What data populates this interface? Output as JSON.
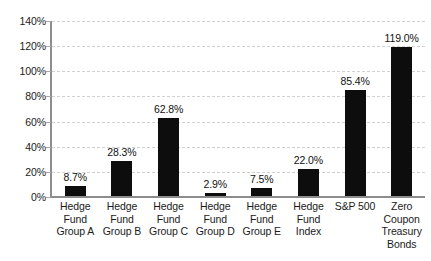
{
  "chart_data": {
    "type": "bar",
    "title": "",
    "subtitle": "",
    "xlabel": "",
    "ylabel": "",
    "ylim": [
      0,
      140
    ],
    "ytick_labels": [
      "140%",
      "120%",
      "100%",
      "80%",
      "60%",
      "40%",
      "20%",
      "0%"
    ],
    "ytick_values": [
      140,
      120,
      100,
      80,
      60,
      40,
      20,
      0
    ],
    "ytick_format": "percent",
    "grid": true,
    "grid_style": "dashed",
    "grid_axis": "y",
    "legend": "none",
    "bar_color": "#0d0d0d",
    "gridline_color": "#d2d2d2",
    "axis_color": "#8c8c8c",
    "categories": [
      "Hedge Fund Group A",
      "Hedge Fund Group B",
      "Hedge Fund Group C",
      "Hedge Fund Group D",
      "Hedge Fund Group E",
      "Hedge Fund Index",
      "S&P 500",
      "Zero Coupon Treasury Bonds"
    ],
    "category_label_lines": [
      [
        "Hedge",
        "Fund",
        "Group A"
      ],
      [
        "Hedge",
        "Fund",
        "Group B"
      ],
      [
        "Hedge",
        "Fund",
        "Group C"
      ],
      [
        "Hedge",
        "Fund",
        "Group D"
      ],
      [
        "Hedge",
        "Fund",
        "Group E"
      ],
      [
        "Hedge",
        "Fund",
        "Index"
      ],
      [
        "S&P 500"
      ],
      [
        "Zero",
        "Coupon",
        "Treasury",
        "Bonds"
      ]
    ],
    "values": [
      8.7,
      28.3,
      62.8,
      2.9,
      7.5,
      22.0,
      85.4,
      119.0
    ],
    "data_labels": [
      "8.7%",
      "28.3%",
      "62.8%",
      "2.9%",
      "7.5%",
      "22.0%",
      "85.4%",
      "119.0%"
    ]
  }
}
